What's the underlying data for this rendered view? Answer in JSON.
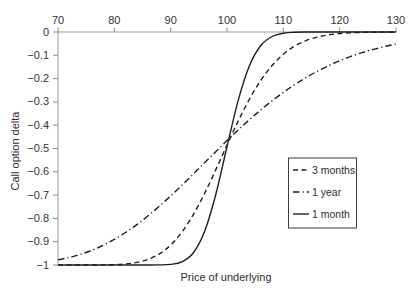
{
  "colors": {
    "background": "#ffffff",
    "axis": "#9a9a9a",
    "curve": "#1f1f1f",
    "text": "#333333"
  },
  "chart_data": {
    "type": "line",
    "title": "",
    "xlabel": "Price of underlying",
    "ylabel": "Call option delta",
    "x_axis_position": "top",
    "grid": false,
    "xlim": [
      70,
      130
    ],
    "ylim": [
      -1,
      0
    ],
    "x_ticks": [
      70,
      80,
      90,
      100,
      110,
      120,
      130
    ],
    "y_ticks": [
      0,
      -0.1,
      -0.2,
      -0.3,
      -0.4,
      -0.5,
      -0.6,
      -0.7,
      -0.8,
      -0.9,
      -1
    ],
    "y_tick_labels": [
      "0",
      "−0.1",
      "−0.2",
      "−0.3",
      "−0.4",
      "−0.5",
      "−0.6",
      "−0.7",
      "−0.8",
      "−0.9",
      "−1"
    ],
    "legend": {
      "position": "inside-right",
      "entries": [
        "3 months",
        "1 year",
        "1 month"
      ]
    },
    "x": [
      70,
      72,
      74,
      76,
      78,
      80,
      82,
      84,
      86,
      88,
      90,
      92,
      94,
      96,
      98,
      100,
      102,
      104,
      106,
      108,
      110,
      112,
      114,
      116,
      118,
      120,
      122,
      124,
      126,
      128,
      130
    ],
    "series": [
      {
        "name": "3 months",
        "style": "dashed",
        "values": [
          -1.0,
          -1.0,
          -1.0,
          -0.9999,
          -0.9995,
          -0.9983,
          -0.9955,
          -0.9889,
          -0.9758,
          -0.9522,
          -0.9147,
          -0.8586,
          -0.7845,
          -0.6938,
          -0.5917,
          -0.485,
          -0.3815,
          -0.2876,
          -0.2077,
          -0.1438,
          -0.0954,
          -0.0607,
          -0.0372,
          -0.0219,
          -0.0124,
          -0.0068,
          -0.0036,
          -0.0018,
          -0.0009,
          -0.0004,
          -0.0002
        ]
      },
      {
        "name": "1 year",
        "style": "dashdot",
        "values": [
          -0.9779,
          -0.9677,
          -0.9541,
          -0.9369,
          -0.9157,
          -0.8902,
          -0.8605,
          -0.8265,
          -0.7888,
          -0.7476,
          -0.7036,
          -0.6574,
          -0.6099,
          -0.5616,
          -0.5135,
          -0.4661,
          -0.4202,
          -0.3761,
          -0.3344,
          -0.2954,
          -0.2593,
          -0.2261,
          -0.196,
          -0.169,
          -0.1449,
          -0.1235,
          -0.1048,
          -0.0885,
          -0.0743,
          -0.0622,
          -0.0517
        ]
      },
      {
        "name": "1 month",
        "style": "solid",
        "values": [
          -1.0,
          -1.0,
          -1.0,
          -1.0,
          -1.0,
          -1.0,
          -1.0,
          -1.0,
          -1.0,
          -0.9996,
          -0.9974,
          -0.9862,
          -0.9484,
          -0.8575,
          -0.6983,
          -0.4925,
          -0.2923,
          -0.1437,
          -0.058,
          -0.0193,
          -0.0053,
          -0.0012,
          -0.0002,
          0.0,
          0.0,
          0.0,
          0.0,
          0.0,
          0.0,
          0.0,
          0.0
        ]
      }
    ]
  }
}
